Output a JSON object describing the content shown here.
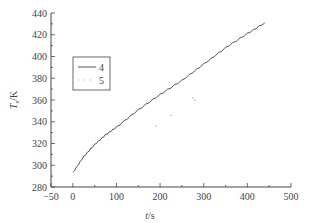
{
  "chart_data": {
    "type": "line",
    "title": "",
    "xlabel": "t/s",
    "ylabel": "T_s/K",
    "xlim": [
      -50,
      500
    ],
    "ylim": [
      280,
      440
    ],
    "xticks": [
      -50,
      0,
      100,
      200,
      300,
      400,
      500
    ],
    "yticks": [
      280,
      300,
      320,
      340,
      360,
      380,
      400,
      420,
      440
    ],
    "grid": false,
    "legend_position": "upper-left",
    "series": [
      {
        "name": "4",
        "style": "solid",
        "color": "#555555",
        "x": [
          0,
          25,
          50,
          75,
          100,
          150,
          200,
          250,
          300,
          350,
          400,
          440
        ],
        "y": [
          293,
          308,
          319,
          328,
          335,
          351,
          365,
          378,
          393,
          408,
          421,
          431
        ]
      },
      {
        "name": "5",
        "style": "dotted",
        "color": "#999999",
        "x": [
          190,
          225,
          280,
          275
        ],
        "y": [
          336,
          346,
          360,
          362
        ]
      }
    ]
  },
  "axes": {
    "xlabel_italic": "t",
    "xlabel_unit": "/s",
    "ylabel_italic": "T",
    "ylabel_sub": "s",
    "ylabel_unit": "/K"
  },
  "legend": {
    "items": [
      {
        "label": "4"
      },
      {
        "label": "5"
      }
    ]
  }
}
